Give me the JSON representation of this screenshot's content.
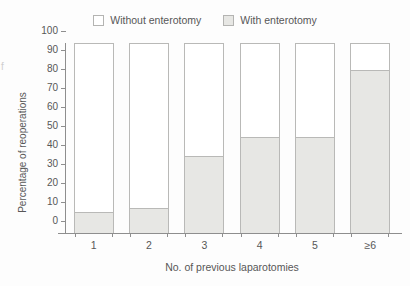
{
  "chart_data": {
    "type": "bar",
    "stacked": true,
    "title": "",
    "xlabel": "No. of previous laparotomies",
    "ylabel": "Percentage of reoperations",
    "categories": [
      "1",
      "2",
      "3",
      "4",
      "5",
      "≥6"
    ],
    "ylim": [
      0,
      100
    ],
    "yticks": [
      0,
      10,
      20,
      30,
      40,
      50,
      60,
      70,
      80,
      90,
      100
    ],
    "grid": false,
    "legend_position": "top-center",
    "series": [
      {
        "name": "With enterotomy",
        "color": "#e7e7e4",
        "values": [
          11,
          13,
          41,
          51,
          51,
          86
        ]
      },
      {
        "name": "Without enterotomy",
        "color": "#ffffff",
        "values": [
          89,
          87,
          59,
          49,
          49,
          14
        ]
      }
    ]
  },
  "legend": {
    "items": [
      {
        "label": "Without enterotomy",
        "swatch": "white-swatch-icon"
      },
      {
        "label": "With enterotomy",
        "swatch": "gray-swatch-icon"
      }
    ]
  },
  "axes": {
    "y_title": "Percentage of reoperations",
    "x_title": "No. of previous laparotomies",
    "y_tick_labels": [
      "100",
      "90",
      "80",
      "70",
      "60",
      "50",
      "40",
      "30",
      "20",
      "10",
      "0"
    ],
    "x_tick_labels": [
      "1",
      "2",
      "3",
      "4",
      "5",
      "≥6"
    ]
  },
  "artifacts": {
    "left_edge_glyph": "f"
  }
}
